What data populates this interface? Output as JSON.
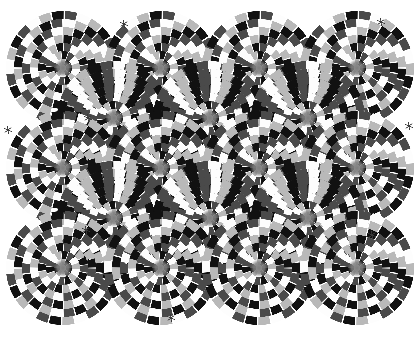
{
  "image": {
    "title": "Rotating Snakes",
    "subtitle": "Peripheral drift optical illusion",
    "type": "optical-illusion",
    "variant": "grayscale",
    "width": 419,
    "height": 338,
    "background_color": "#ffffff",
    "alt_text": "Grid of overlapping concentric ring discs made of black, gray and white blocks producing an illusion of rotation"
  },
  "palette": {
    "background": "#ffffff",
    "black": "#111111",
    "dark_gray": "#4a4a4a",
    "white": "#fdfdfd",
    "light_gray": "#b9b9b9",
    "mid_gray": "#8a8a8a",
    "hub_gray": "#7e7e7e",
    "speck": "#3a3a3a"
  },
  "chart_data": {
    "type": "scatter",
    "subtitle": "Staggered (hexagonal) arrangement of concentric-ring discs",
    "xlabel": "x (px)",
    "ylabel": "y (px)",
    "xlim": [
      0,
      419
    ],
    "ylim": [
      0,
      338
    ],
    "grid": false,
    "legend": "none",
    "disc_radius": 57,
    "ring_count": 7,
    "blocks_outer_ring": 26,
    "hub_radius": 9,
    "phase_sequence": [
      "black",
      "dark_gray",
      "white",
      "light_gray"
    ],
    "rows": [
      {
        "row": 1,
        "cy": 68,
        "cx": [
          63,
          161,
          259,
          357
        ],
        "spin": 1
      },
      {
        "row": 2,
        "cy": 118,
        "cx": [
          114,
          210,
          308
        ],
        "spin": -1
      },
      {
        "row": 3,
        "cy": 168,
        "cx": [
          63,
          161,
          259,
          357
        ],
        "spin": 1
      },
      {
        "row": 4,
        "cy": 218,
        "cx": [
          114,
          210,
          308
        ],
        "spin": -1
      },
      {
        "row": 5,
        "cy": 268,
        "cx": [
          63,
          161,
          259,
          357
        ],
        "spin": 1
      }
    ],
    "disc_centers": [
      [
        63,
        68
      ],
      [
        161,
        68
      ],
      [
        259,
        68
      ],
      [
        357,
        68
      ],
      [
        114,
        118
      ],
      [
        210,
        118
      ],
      [
        308,
        118
      ],
      [
        63,
        168
      ],
      [
        161,
        168
      ],
      [
        259,
        168
      ],
      [
        357,
        168
      ],
      [
        114,
        218
      ],
      [
        210,
        218
      ],
      [
        308,
        218
      ],
      [
        63,
        268
      ],
      [
        161,
        268
      ],
      [
        259,
        268
      ],
      [
        357,
        268
      ]
    ],
    "disc_count": 18,
    "specks": [
      [
        124,
        24
      ],
      [
        381,
        22
      ],
      [
        88,
        118
      ],
      [
        8,
        130
      ],
      [
        409,
        126
      ],
      [
        171,
        318
      ],
      [
        86,
        230
      ],
      [
        372,
        235
      ],
      [
        900,
        900
      ]
    ],
    "speck_count": 8
  },
  "render": {
    "ring_radii": [
      9,
      17,
      25,
      33,
      41,
      49,
      57
    ],
    "blocks_per_ring": [
      10,
      14,
      18,
      20,
      22,
      24,
      26
    ],
    "twist_per_ring_deg": 6
  }
}
